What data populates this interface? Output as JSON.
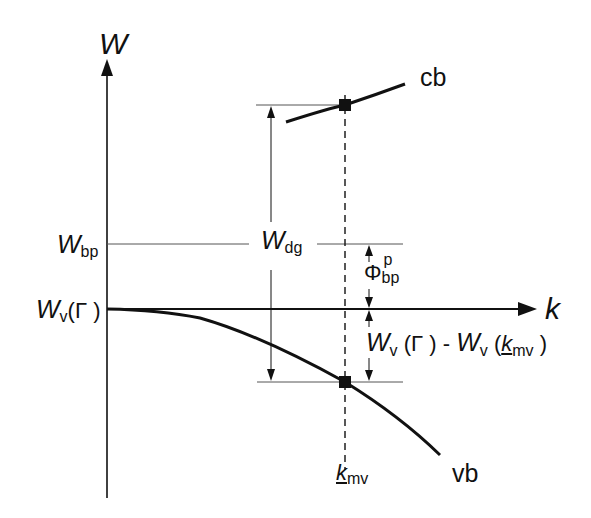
{
  "diagram": {
    "axes": {
      "y_label": "W",
      "x_label": "k"
    },
    "bands": {
      "conduction": "cb",
      "valence": "vb"
    },
    "levels": {
      "wbp_main": "W",
      "wbp_sub": "bp",
      "wvg_main": "W",
      "wvg_sub": "v",
      "wvg_paren": "(Γ )"
    },
    "annotations": {
      "wdg_main": "W",
      "wdg_sub": "dg",
      "phi_main": "Φ",
      "phi_sub": "bp",
      "phi_sup": "p",
      "diff_w1": "W",
      "diff_s1": "v",
      "diff_p1": " (Γ ) - ",
      "diff_w2": "W",
      "diff_s2": "v",
      "diff_p2a": " (",
      "diff_k": "k",
      "diff_ksub": "mv",
      "diff_p2b": " )",
      "kmv_main": "k",
      "kmv_sub": "mv"
    },
    "colors": {
      "line": "#111111",
      "thin": "#555555",
      "background": "#ffffff"
    }
  }
}
